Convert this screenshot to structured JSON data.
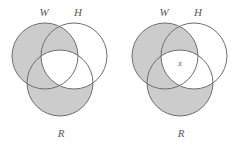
{
  "figure": {
    "type": "venn-diagram-pair",
    "background_color": "#ffffff",
    "shade_color": "#cccccc",
    "unshaded_color": "#ffffff",
    "stroke_color": "#6d6e71",
    "label_color": "#58595b",
    "panels": [
      {
        "id": "left",
        "name": "venn-diagram-left",
        "labels": {
          "set_w": "W",
          "set_h": "H",
          "set_r": "R"
        },
        "element_labels": [],
        "circles": [
          {
            "id": "W",
            "cx": 45,
            "cy": 56,
            "r": 33
          },
          {
            "id": "H",
            "cx": 74,
            "cy": 56,
            "r": 33
          },
          {
            "id": "R",
            "cx": 60,
            "cy": 83,
            "r": 33
          }
        ],
        "shaded_regions": [
          "W only",
          "R only",
          "W and H only",
          "W and R only"
        ],
        "unshaded_regions": [
          "H only",
          "H and R only",
          "W and H and R"
        ]
      },
      {
        "id": "right",
        "name": "venn-diagram-right",
        "labels": {
          "set_w": "W",
          "set_h": "H",
          "set_r": "R"
        },
        "element_labels": [
          {
            "text": "x",
            "region": "W and H and R",
            "x": 60,
            "cy": 63
          }
        ],
        "circles": [
          {
            "id": "W",
            "cx": 45,
            "cy": 56,
            "r": 33
          },
          {
            "id": "H",
            "cx": 74,
            "cy": 56,
            "r": 33
          },
          {
            "id": "R",
            "cx": 60,
            "cy": 83,
            "r": 33
          }
        ],
        "shaded_regions": [
          "W only",
          "R only",
          "W and H only",
          "W and R only"
        ],
        "unshaded_regions": [
          "H only",
          "H and R only",
          "W and H and R"
        ]
      }
    ]
  }
}
